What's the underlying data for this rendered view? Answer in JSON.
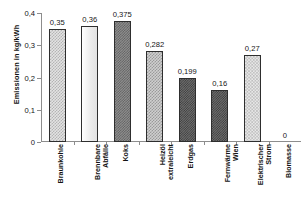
{
  "chart_data": {
    "type": "bar",
    "title": "",
    "subtitle": "",
    "xlabel": "",
    "ylabel": "Emissionen in kg/kWh",
    "ylim": [
      0,
      0.4
    ],
    "ytick_values": [
      0,
      0.1,
      0.2,
      0.3,
      0.4
    ],
    "ytick_labels": [
      "0",
      "0,1",
      "0,2",
      "0,3",
      "0,4"
    ],
    "grid": false,
    "legend": "none",
    "decimal_separator": ",",
    "categories": [
      "Braunkohle",
      "Brennbare\nAbfälle",
      "Koks",
      "Heizöl\nextraleicht",
      "Erdgas",
      "Fernwärme\nWien",
      "Elektrischer\nStrom",
      "Biomasse"
    ],
    "values": [
      0.35,
      0.36,
      0.375,
      0.282,
      0.199,
      0.16,
      0.27,
      0
    ],
    "value_labels": [
      "0,35",
      "0,36",
      "0,375",
      "0,282",
      "0,199",
      "0,16",
      "0,27",
      "0"
    ],
    "bar_patterns": [
      "check-light",
      "plain-light",
      "check-dark",
      "check-mid",
      "check-darkest",
      "check-darkest",
      "dot-light",
      "none"
    ],
    "colors": {
      "axis": "#8d8d8d",
      "text": "#141414",
      "bar_outline": "#2e2e2e",
      "background": "#ffffff"
    }
  }
}
